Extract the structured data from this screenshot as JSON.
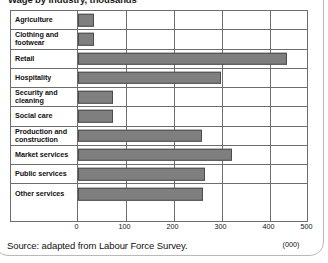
{
  "card": {
    "title": "Wage by industry, thousands",
    "source": "Source: adapted from Labour Force Survey.",
    "unit_label": "(000)"
  },
  "chart_data": {
    "type": "bar",
    "orientation": "horizontal",
    "title": "Wage by industry, thousands",
    "xlabel": "(000)",
    "ylabel": "",
    "xlim": [
      0,
      500
    ],
    "xticks": [
      0,
      100,
      200,
      300,
      400,
      500
    ],
    "xtick_labels": [
      "0",
      "100",
      "200",
      "300",
      "400",
      "500"
    ],
    "grid": true,
    "legend": false,
    "bar_color": "#7f7f7f",
    "bar_edge_color": "#4c4c4c",
    "grid_color": "#6d6d6d",
    "categories": [
      "Agriculture",
      "Clothing and footwear",
      "Retail",
      "Hospitality",
      "Security and cleaning",
      "Social care",
      "Production and construction",
      "Market services",
      "Public services",
      "Other services"
    ],
    "values": [
      35,
      35,
      455,
      313,
      77,
      77,
      271,
      335,
      278,
      273
    ],
    "source_note": "Source: adapted from Labour Force Survey."
  }
}
